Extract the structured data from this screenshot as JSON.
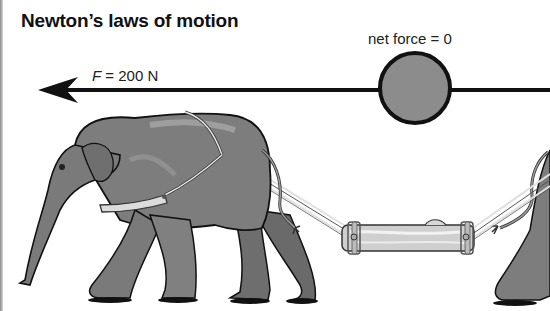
{
  "title": "Newton’s laws of motion",
  "force": {
    "variable": "F",
    "equals": " = 200 N",
    "direction": "left"
  },
  "net_force_label": "net force = 0",
  "colors": {
    "background": "#ffffff",
    "arrow": "#111111",
    "ball_fill": "#8c8c8c",
    "ball_stroke": "#111111",
    "elephant_body": "#7d7d7d",
    "elephant_shadow": "#5e5e5e",
    "elephant_highlight": "#a3a3a3",
    "harness": "#d9d9d9",
    "log": "#c9c9c9"
  },
  "scene": {
    "elements": [
      "force-arrow",
      "ball",
      "left-elephant",
      "harness",
      "ropes",
      "log",
      "right-elephant-partial"
    ]
  }
}
